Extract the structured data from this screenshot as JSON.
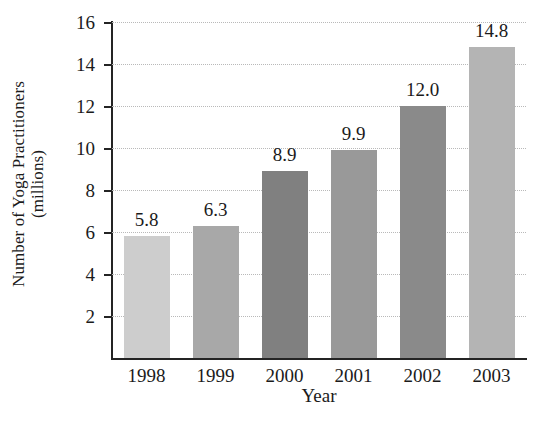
{
  "chart_data": {
    "type": "bar",
    "title": "",
    "categories": [
      "1998",
      "1999",
      "2000",
      "2001",
      "2002",
      "2003"
    ],
    "values": [
      5.8,
      6.3,
      8.9,
      9.9,
      12.0,
      14.8
    ],
    "value_labels": [
      "5.8",
      "6.3",
      "8.9",
      "9.9",
      "12.0",
      "14.8"
    ],
    "xlabel": "Year",
    "ylabel_line1": "Number of Yoga Practitioners",
    "ylabel_line2": "(millions)",
    "ylim": [
      0,
      16
    ],
    "yticks": [
      2,
      4,
      6,
      8,
      10,
      12,
      14,
      16
    ],
    "ytick_labels": [
      "2",
      "4",
      "6",
      "8",
      "10",
      "12",
      "14",
      "16"
    ],
    "grid": true,
    "grid_axis": "y",
    "grid_style": "dotted",
    "legend": "none",
    "bar_colors": [
      "#cdcdcd",
      "#a8a8a8",
      "#808080",
      "#999999",
      "#8a8a8a",
      "#b4b4b4"
    ],
    "axis_color": "#242424",
    "grid_color": "#b9b9b9",
    "background": "#ffffff"
  }
}
